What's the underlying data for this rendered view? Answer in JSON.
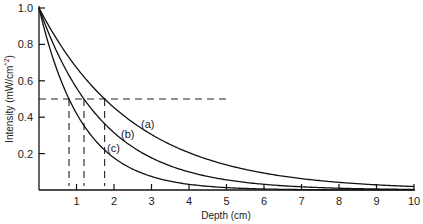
{
  "chart_data": {
    "type": "line",
    "title": "",
    "xlabel": "Depth (cm)",
    "ylabel": "Intensity (mW/cm^2)",
    "xlim": [
      0,
      10
    ],
    "ylim": [
      0,
      1.0
    ],
    "x_ticks": [
      "1",
      "2",
      "3",
      "4",
      "5",
      "6",
      "7",
      "8",
      "9",
      "10"
    ],
    "y_ticks": [
      "0.2",
      "0.4",
      "0.6",
      "0.8",
      "1.0"
    ],
    "grid": false,
    "legend": "none (inline curve labels)",
    "series": [
      {
        "name": "(a)",
        "model": "exponential decay",
        "half_value_depth_cm": 1.75,
        "x": [
          0,
          1,
          2,
          3,
          4,
          5,
          6,
          7,
          8,
          9,
          10
        ],
        "values": [
          1.0,
          0.67,
          0.45,
          0.3,
          0.2,
          0.14,
          0.09,
          0.06,
          0.04,
          0.03,
          0.02
        ]
      },
      {
        "name": "(b)",
        "model": "exponential decay",
        "half_value_depth_cm": 1.2,
        "x": [
          0,
          1,
          2,
          3,
          4,
          5,
          6,
          7,
          8,
          9,
          10
        ],
        "values": [
          1.0,
          0.56,
          0.31,
          0.18,
          0.1,
          0.06,
          0.03,
          0.02,
          0.01,
          0.01,
          0.0
        ]
      },
      {
        "name": "(c)",
        "model": "exponential decay",
        "half_value_depth_cm": 0.8,
        "x": [
          0,
          1,
          2,
          3,
          4,
          5,
          6,
          7,
          8,
          9,
          10
        ],
        "values": [
          1.0,
          0.42,
          0.18,
          0.07,
          0.03,
          0.01,
          0.01,
          0.0,
          0.0,
          0.0,
          0.0
        ]
      }
    ],
    "annotations": [
      {
        "type": "hline",
        "y": 0.5,
        "x_range": [
          0,
          5.1
        ],
        "style": "dashed"
      },
      {
        "type": "vline",
        "x": 0.8,
        "y_range": [
          0,
          0.5
        ],
        "style": "dashed",
        "series": "(c)"
      },
      {
        "type": "vline",
        "x": 1.2,
        "y_range": [
          0,
          0.5
        ],
        "style": "dashed",
        "series": "(b)"
      },
      {
        "type": "vline",
        "x": 1.75,
        "y_range": [
          0,
          0.5
        ],
        "style": "dashed",
        "series": "(a)"
      }
    ]
  },
  "labels": {
    "xlabel": "Depth (cm)",
    "ylabel": "Intensity (mW/cm",
    "ylabel_sup": "^2",
    "ylabel_close": ")",
    "curve_a": "(a)",
    "curve_b": "(b)",
    "curve_c": "(c)"
  }
}
